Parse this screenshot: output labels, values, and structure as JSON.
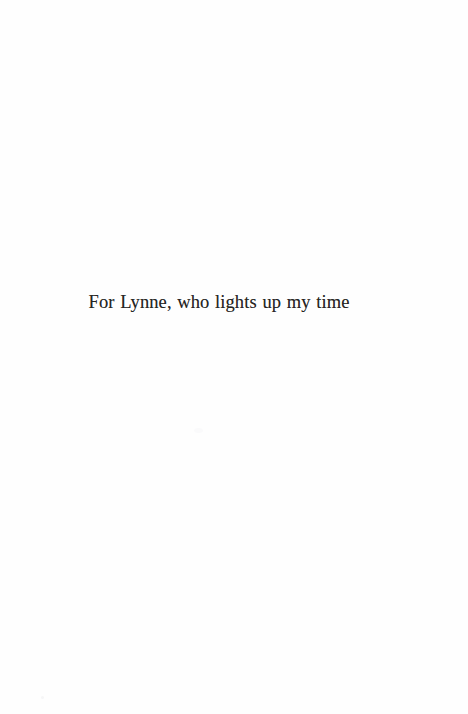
{
  "page": {
    "kind": "book-dedication-page",
    "width": 468,
    "height": 714,
    "background_color": "#fefefe",
    "text_color": "#262523"
  },
  "dedication": {
    "text": "For Lynne, who lights up my time"
  },
  "artifacts": [
    {
      "name": "scan-speck-center",
      "color": "#fafafb"
    },
    {
      "name": "scan-speck-lower-left",
      "color": "#f6f6f7"
    }
  ]
}
